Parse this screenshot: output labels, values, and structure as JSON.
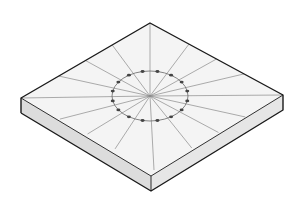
{
  "figure": {
    "colors": {
      "background": "#ffffff",
      "top_face": "#f4f4f4",
      "left_side": "#dcdcdc",
      "right_side": "#e6e6e6",
      "outline": "#1a1a1a",
      "radial_lines": "#8a8a8a",
      "ring": "#666666",
      "dots": "#444444"
    },
    "geometry": {
      "top_corner": [
        150,
        23
      ],
      "left_corner": [
        21,
        98
      ],
      "right_corner": [
        283,
        95
      ],
      "front_corner": [
        151,
        176
      ],
      "thickness": 15,
      "center": [
        150,
        96
      ],
      "ring_rx": 38,
      "ring_ry": 25,
      "radial_line_count": 16,
      "dot_count": 16
    }
  }
}
